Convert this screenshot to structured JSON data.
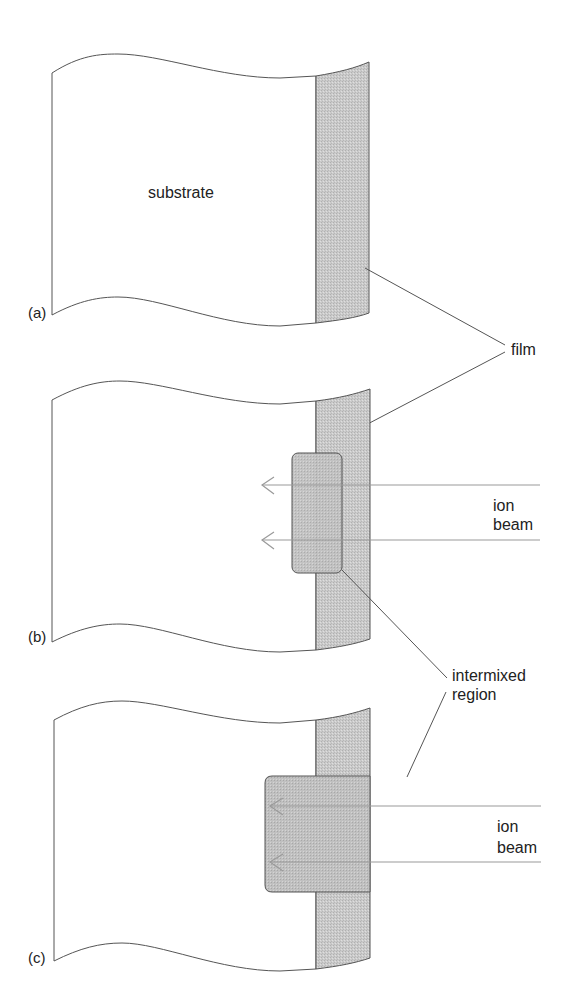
{
  "figure": {
    "panels": [
      {
        "id": "a",
        "label": "(a)",
        "inner_text": "substrate"
      },
      {
        "id": "b",
        "label": "(b)"
      },
      {
        "id": "c",
        "label": "(c)"
      }
    ],
    "labels": {
      "film": "film",
      "ion_beam_b_line1": "ion",
      "ion_beam_b_line2": "beam",
      "ion_beam_c_line1": "ion",
      "ion_beam_c_line2": "beam",
      "intermixed_line1": "intermixed",
      "intermixed_line2": "region"
    },
    "colors": {
      "outline": "#555555",
      "film_fill": "#c8c8c8",
      "intermixed_fill": "#bdbdbd",
      "beam": "#9a9a9a",
      "text": "#222222"
    }
  }
}
